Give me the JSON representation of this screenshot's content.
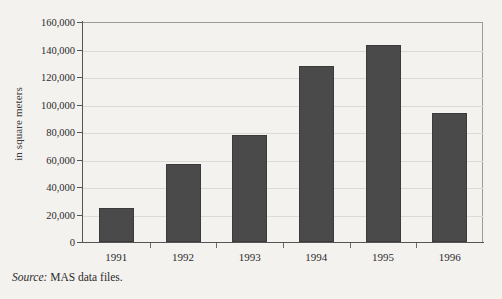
{
  "chart_data": {
    "type": "bar",
    "title": "",
    "subtitle": "",
    "xlabel": "",
    "ylabel": "in square meters",
    "categories": [
      "1991",
      "1992",
      "1993",
      "1994",
      "1995",
      "1996"
    ],
    "values": [
      25000,
      57000,
      78000,
      128000,
      143000,
      94000
    ],
    "ylim": [
      0,
      160000
    ],
    "ytick_step": 20000,
    "ytick_labels": [
      "0",
      "20,000",
      "40,000",
      "60,000",
      "80,000",
      "100,000",
      "120,000",
      "140,000",
      "160,000"
    ],
    "ytick_values": [
      0,
      20000,
      40000,
      60000,
      80000,
      100000,
      120000,
      140000,
      160000
    ],
    "grid": true,
    "grid_axis": "y",
    "legend": false,
    "legend_position": "none",
    "bar_color": "#4a4a4a",
    "bar_edge_color": "#3b3b3b",
    "grid_color": "#dcdad6",
    "axis_color": "#555555",
    "background_color": "#f4f2ef"
  },
  "source": {
    "label": "Source:",
    "text": "MAS data files."
  }
}
